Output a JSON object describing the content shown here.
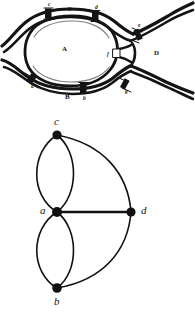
{
  "figure": {
    "panels": [
      {
        "id": "map",
        "caption": ""
      },
      {
        "id": "graph",
        "caption": ""
      }
    ]
  },
  "map": {
    "description": "Engraved plan of the river with four land regions joined by seven bridges",
    "ink_color": "#141414",
    "paper_color": "#ffffff",
    "region_labels": [
      {
        "id": "region-A",
        "text": "A",
        "x": 62,
        "y": 46
      },
      {
        "id": "region-B",
        "text": "B",
        "x": 65,
        "y": 94
      },
      {
        "id": "region-C",
        "text": "C",
        "x": 67,
        "y": 6
      },
      {
        "id": "region-D",
        "text": "D",
        "x": 154,
        "y": 50
      }
    ],
    "bridge_labels": [
      {
        "id": "bridge-c",
        "text": "c",
        "x": 48,
        "y": 12
      },
      {
        "id": "bridge-d",
        "text": "d",
        "x": 95,
        "y": 13
      },
      {
        "id": "bridge-e",
        "text": "e",
        "x": 138,
        "y": 26
      },
      {
        "id": "bridge-a",
        "text": "a",
        "x": 31,
        "y": 79
      },
      {
        "id": "bridge-b",
        "text": "b",
        "x": 83,
        "y": 87
      },
      {
        "id": "bridge-f",
        "text": "f",
        "x": 106,
        "y": 55
      },
      {
        "id": "bridge-g",
        "text": "g",
        "x": 125,
        "y": 84
      }
    ]
  },
  "graph": {
    "description": "Multigraph of the Königsberg bridges: four vertices and seven edges",
    "stroke_color": "#111111",
    "node_color": "#111111",
    "nodes": [
      {
        "id": "c",
        "label": "c",
        "x": 57,
        "y": 27,
        "label_x": 54,
        "label_y": 9
      },
      {
        "id": "a",
        "label": "a",
        "x": 57,
        "y": 104,
        "label_x": 41,
        "label_y": 98
      },
      {
        "id": "d",
        "label": "d",
        "x": 131,
        "y": 104,
        "label_x": 141,
        "label_y": 98
      },
      {
        "id": "b",
        "label": "b",
        "x": 57,
        "y": 180,
        "label_x": 54,
        "label_y": 189
      }
    ],
    "edges": [
      {
        "id": "edge-ac-left",
        "from": "a",
        "to": "c",
        "curve": "left",
        "bulge": 24
      },
      {
        "id": "edge-ac-right",
        "from": "a",
        "to": "c",
        "curve": "right",
        "bulge": 16
      },
      {
        "id": "edge-ab-left",
        "from": "a",
        "to": "b",
        "curve": "left",
        "bulge": 24
      },
      {
        "id": "edge-ab-right",
        "from": "a",
        "to": "b",
        "curve": "right",
        "bulge": 16
      },
      {
        "id": "edge-ad",
        "from": "a",
        "to": "d",
        "curve": "straight",
        "bulge": 0
      },
      {
        "id": "edge-cd",
        "from": "c",
        "to": "d",
        "curve": "outer",
        "bulge": 22
      },
      {
        "id": "edge-bd",
        "from": "b",
        "to": "d",
        "curve": "outer",
        "bulge": 22
      }
    ],
    "edge_count": 7,
    "node_count": 4
  }
}
